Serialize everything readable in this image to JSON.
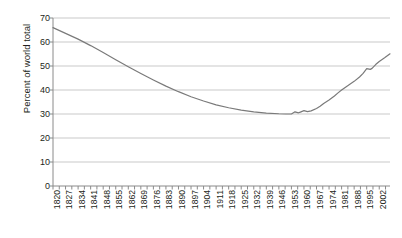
{
  "chart_data": {
    "type": "line",
    "title": "",
    "subtitle": "",
    "xlabel": "",
    "ylabel": "Percent of world total",
    "xlim": [
      1820,
      2008
    ],
    "ylim": [
      0,
      70
    ],
    "ytick_step": 10,
    "grid": true,
    "grid_axis": "y",
    "legend": false,
    "legend_position": "none",
    "line_color": "#7a7a7a",
    "grid_color": "#c9c9c9",
    "axis_color": "#8a8a8a",
    "text_color": "#231f20",
    "background": "#ffffff",
    "ytick_labels": [
      "0",
      "10",
      "20",
      "30",
      "40",
      "50",
      "60",
      "70"
    ],
    "ytick_values": [
      0,
      10,
      20,
      30,
      40,
      50,
      60,
      70
    ],
    "xtick_labels": [
      "1820",
      "1827",
      "1834",
      "1841",
      "1848",
      "1855",
      "1862",
      "1869",
      "1876",
      "1883",
      "1890",
      "1897",
      "1904",
      "1911",
      "1918",
      "1925",
      "1932",
      "1939",
      "1946",
      "1953",
      "1960",
      "1967",
      "1974",
      "1981",
      "1988",
      "1995",
      "2002"
    ],
    "xtick_values": [
      1820,
      1827,
      1834,
      1841,
      1848,
      1855,
      1862,
      1869,
      1876,
      1883,
      1890,
      1897,
      1904,
      1911,
      1918,
      1925,
      1932,
      1939,
      1946,
      1953,
      1960,
      1967,
      1974,
      1981,
      1988,
      1995,
      2002
    ],
    "minor_tick_step": 3.5,
    "series": [
      {
        "name": "Percent of world total",
        "color": "#7a7a7a",
        "x": [
          1820,
          1827,
          1834,
          1841,
          1848,
          1855,
          1862,
          1869,
          1876,
          1883,
          1890,
          1897,
          1904,
          1911,
          1918,
          1925,
          1932,
          1939,
          1946,
          1950,
          1953,
          1955,
          1957,
          1958,
          1960,
          1962,
          1964,
          1967,
          1969,
          1971,
          1974,
          1977,
          1979,
          1981,
          1984,
          1986,
          1988,
          1991,
          1993,
          1995,
          1997,
          1998,
          2000,
          2002,
          2005,
          2008
        ],
        "values": [
          66.0,
          63.6,
          61.2,
          58.5,
          55.6,
          52.6,
          49.7,
          46.9,
          44.2,
          41.6,
          39.3,
          37.2,
          35.4,
          33.8,
          32.6,
          31.6,
          30.9,
          30.4,
          30.1,
          30.0,
          30.0,
          30.9,
          30.5,
          30.8,
          31.4,
          31.0,
          31.3,
          32.3,
          33.2,
          34.4,
          35.8,
          37.5,
          38.8,
          40.0,
          41.6,
          42.6,
          43.6,
          45.4,
          46.9,
          48.9,
          48.6,
          49.0,
          50.6,
          51.9,
          53.4,
          55.1
        ]
      }
    ]
  }
}
